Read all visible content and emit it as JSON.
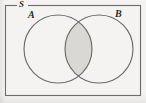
{
  "figure": {
    "type": "venn-diagram",
    "background_color": "#f4f3f1",
    "stroke_color": "#6b6b69",
    "shade_color": "#d9d8d5",
    "label_color": "#2a2a28"
  },
  "labels": {
    "universal_set": "S",
    "set_a": "A",
    "set_b": "B"
  },
  "geometry": {
    "rectangle": {
      "x": 5,
      "y": 5,
      "width": 136,
      "height": 91
    },
    "circle_a": {
      "cx": 58,
      "cy": 49,
      "r": 34
    },
    "circle_b": {
      "cx": 99,
      "cy": 49,
      "r": 34
    },
    "shaded_region": "A-intersect-B"
  }
}
